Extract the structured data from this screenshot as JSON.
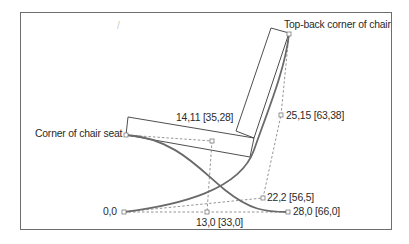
{
  "diagram": {
    "colors": {
      "curve": "#6a6a6a",
      "outline": "#3a3a3a",
      "dashed": "#7a7a7a",
      "frame": "#6e6e6e",
      "text": "#2a2a2a"
    },
    "annotations": {
      "top_back_corner": "Top-back corner of chair",
      "seat_corner": "Corner of chair seat"
    },
    "points": [
      {
        "id": "origin",
        "label": "0,0"
      },
      {
        "id": "p13_0",
        "label": "13,0 [33,0]"
      },
      {
        "id": "p28_0",
        "label": "28,0 [66,0]"
      },
      {
        "id": "p22_2",
        "label": "22,2 [56,5]"
      },
      {
        "id": "p25_15",
        "label": "25,15 [63,38]"
      },
      {
        "id": "p14_11",
        "label": "14,11 [35,28]"
      }
    ],
    "stray_mark": "/"
  }
}
